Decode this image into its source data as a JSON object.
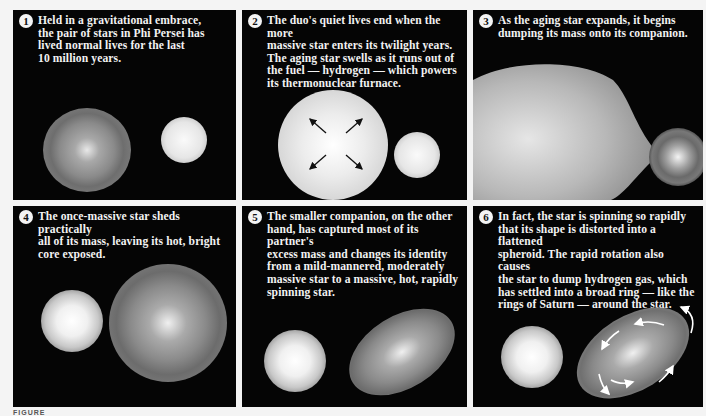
{
  "panels": [
    {
      "number": "1",
      "caption": "Held in a gravitational embrace,\nthe pair of stars in Phi Persei has\nlived normal lives for the last\n10 million years."
    },
    {
      "number": "2",
      "caption": "The duo's quiet lives end when the more\nmassive star enters its twilight years.\nThe aging star swells as it runs out of\nthe fuel — hydrogen — which powers\nits thermonuclear furnace."
    },
    {
      "number": "3",
      "caption": "As the aging star expands, it begins\ndumping its mass onto its companion."
    },
    {
      "number": "4",
      "caption": "The once-massive star sheds practically\nall of its mass, leaving its hot, bright\ncore exposed."
    },
    {
      "number": "5",
      "caption": "The smaller companion, on the other\nhand, has captured most of its partner's\nexcess mass and changes its identity\nfrom a mild-mannered, moderately\nmassive star to a massive, hot, rapidly\nspinning star."
    },
    {
      "number": "6",
      "caption": "In fact, the star is spinning so rapidly\nthat its shape is distorted into a flattened\nspheroid. The rapid rotation also causes\nthe star to dump hydrogen gas,  which\nhas settled into a broad ring — like the\nrings of Saturn — around the star."
    }
  ],
  "figure_caption": "FIGURE",
  "colors": {
    "background": "#050505",
    "page": "#f4f4f4",
    "text": "#f2f2f2"
  }
}
